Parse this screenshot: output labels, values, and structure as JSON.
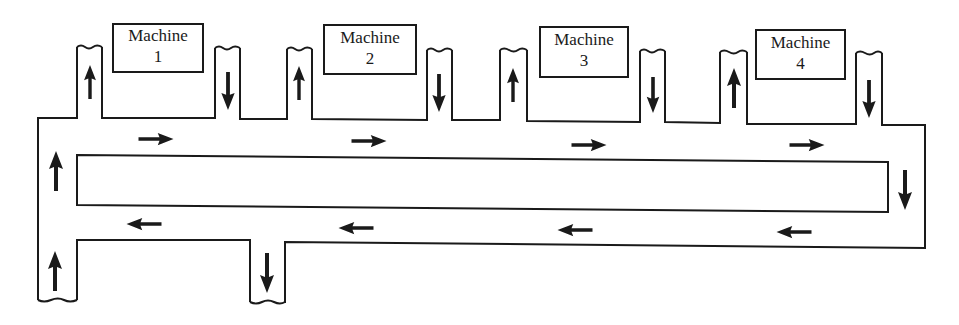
{
  "diagram": {
    "type": "conveyor-loop",
    "flow_direction": "clockwise",
    "machines": [
      {
        "name": "Machine",
        "number": "1"
      },
      {
        "name": "Machine",
        "number": "2"
      },
      {
        "name": "Machine",
        "number": "3"
      },
      {
        "name": "Machine",
        "number": "4"
      }
    ],
    "arrows": {
      "top_lane": [
        "right",
        "right",
        "right",
        "right"
      ],
      "right_side": "down",
      "bottom_lane": [
        "left",
        "left",
        "left",
        "left"
      ],
      "left_side": "up",
      "machine_feed_in": "up",
      "machine_return": "down",
      "system_entry": "up",
      "system_exit": "down"
    },
    "colors": {
      "stroke": "#1a1a1a",
      "background": "#ffffff"
    }
  }
}
